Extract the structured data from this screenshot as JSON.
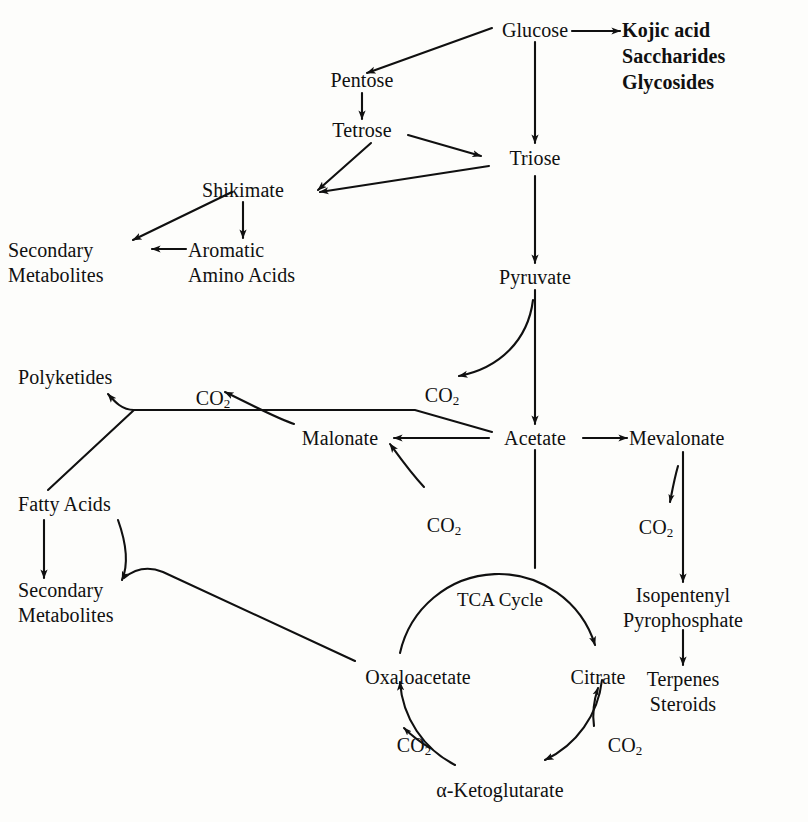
{
  "diagram": {
    "background_color": "#fdfdfb",
    "ink_color": "#101010",
    "cycle_label": "TCA Cycle"
  },
  "nodes": {
    "glucose": "Glucose",
    "kojic_acid": "Kojic acid",
    "saccharides": "Saccharides",
    "glycosides": "Glycosides",
    "pentose": "Pentose",
    "tetrose": "Tetrose",
    "triose": "Triose",
    "shikimate": "Shikimate",
    "secondary_metabolites_top": "Secondary\nMetabolites",
    "aromatic_amino_acids": "Aromatic\nAmino Acids",
    "pyruvate": "Pyruvate",
    "polyketides": "Polyketides",
    "malonate": "Malonate",
    "acetate": "Acetate",
    "mevalonate": "Mevalonate",
    "fatty_acids": "Fatty Acids",
    "secondary_metabolites_bottom": "Secondary\nMetabolites",
    "isopentenyl_pyrophosphate": "Isopentenyl\nPyrophosphate",
    "terpenes_steroids": "Terpenes\nSteroids",
    "oxaloacetate": "Oxaloacetate",
    "citrate": "Citrate",
    "alpha_ketoglutarate": "α-Ketoglutarate"
  },
  "co2_labels": {
    "pyruvate_release": "CO",
    "malonate_release": "CO",
    "malonate_input": "CO",
    "mevalonate_release": "CO",
    "oxaloacetate_release": "CO",
    "citrate_release": "CO",
    "subscript": "2"
  },
  "edges": [
    {
      "from": "Glucose",
      "to": "Kojic acid / Saccharides / Glycosides",
      "style": "straight"
    },
    {
      "from": "Glucose",
      "to": "Pentose",
      "style": "diagonal"
    },
    {
      "from": "Glucose",
      "to": "Triose",
      "style": "vertical"
    },
    {
      "from": "Pentose",
      "to": "Tetrose",
      "style": "vertical"
    },
    {
      "from": "Tetrose",
      "to": "Triose",
      "style": "diagonal"
    },
    {
      "from": "Tetrose",
      "to": "Shikimate",
      "style": "diagonal"
    },
    {
      "from": "Triose",
      "to": "Shikimate",
      "style": "diagonal"
    },
    {
      "from": "Triose",
      "to": "Pyruvate",
      "style": "vertical"
    },
    {
      "from": "Shikimate",
      "to": "Secondary Metabolites",
      "style": "diagonal"
    },
    {
      "from": "Shikimate",
      "to": "Aromatic Amino Acids",
      "style": "vertical"
    },
    {
      "from": "Aromatic Amino Acids",
      "to": "Secondary Metabolites",
      "style": "horizontal"
    },
    {
      "from": "Pyruvate",
      "to": "Acetate",
      "style": "vertical"
    },
    {
      "from": "Pyruvate",
      "to": "CO2",
      "style": "curve"
    },
    {
      "from": "Acetate",
      "to": "Malonate",
      "style": "horizontal"
    },
    {
      "from": "Acetate",
      "to": "Polyketides",
      "style": "polyline"
    },
    {
      "from": "Acetate",
      "to": "Mevalonate",
      "style": "horizontal"
    },
    {
      "from": "Acetate",
      "to": "TCA Cycle",
      "style": "vertical"
    },
    {
      "from": "CO2",
      "to": "Malonate",
      "style": "curve"
    },
    {
      "from": "Malonate",
      "to": "CO2",
      "style": "curve"
    },
    {
      "from": "Fatty Acids",
      "to": "Polyketides",
      "style": "diagonal"
    },
    {
      "from": "Fatty Acids",
      "to": "Secondary Metabolites",
      "style": "vertical"
    },
    {
      "from": "Fatty Acids",
      "to": "Secondary Metabolites",
      "style": "curve"
    },
    {
      "from": "Mevalonate",
      "to": "Isopentenyl Pyrophosphate",
      "style": "vertical"
    },
    {
      "from": "Mevalonate",
      "to": "CO2",
      "style": "curve"
    },
    {
      "from": "Isopentenyl Pyrophosphate",
      "to": "Terpenes Steroids",
      "style": "vertical"
    },
    {
      "from": "Oxaloacetate",
      "to": "Citrate",
      "style": "arc"
    },
    {
      "from": "Citrate",
      "to": "α-Ketoglutarate",
      "style": "arc"
    },
    {
      "from": "α-Ketoglutarate",
      "to": "Oxaloacetate",
      "style": "arc"
    },
    {
      "from": "Oxaloacetate",
      "to": "Secondary Metabolites",
      "style": "polyline"
    }
  ]
}
